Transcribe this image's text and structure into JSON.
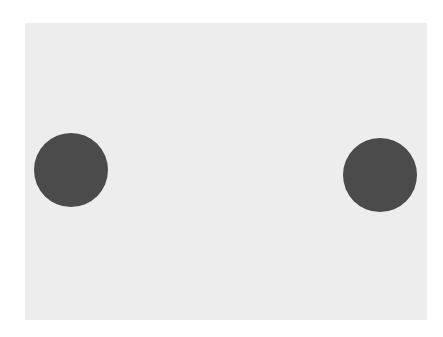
{
  "scene": {
    "canvas": {
      "width": 443,
      "height": 337,
      "background": "#ffffff"
    },
    "panel": {
      "x": 25,
      "y": 23,
      "width": 402,
      "height": 297,
      "color": "#ededed"
    },
    "dots": [
      {
        "label": "left-dot",
        "cx": 71,
        "cy": 170,
        "r": 37,
        "color": "#4b4b4b"
      },
      {
        "label": "right-dot",
        "cx": 380,
        "cy": 175,
        "r": 37,
        "color": "#4b4b4b"
      }
    ]
  }
}
